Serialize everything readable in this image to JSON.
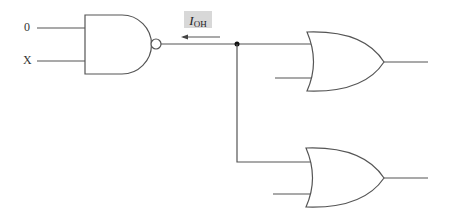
{
  "diagram": {
    "type": "logic-circuit",
    "inputs": [
      {
        "label": "0"
      },
      {
        "label": "X"
      }
    ],
    "current_label": {
      "symbol": "I",
      "subscript": "OH"
    },
    "gates": [
      {
        "type": "NAND",
        "inputs": [
          "0",
          "X"
        ]
      },
      {
        "type": "OR",
        "position": "top"
      },
      {
        "type": "OR",
        "position": "bottom"
      }
    ],
    "colors": {
      "line": "#555555",
      "label_bg": "#d8d8d8"
    }
  }
}
